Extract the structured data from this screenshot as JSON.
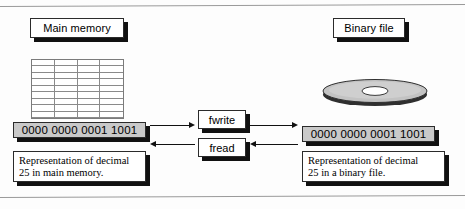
{
  "figure": {
    "type": "data-flow-diagram"
  },
  "labels": {
    "main_memory": "Main memory",
    "binary_file": "Binary file"
  },
  "memory_grid": {
    "columns": 4,
    "rows": 9,
    "name": "main-memory-cells"
  },
  "bars": {
    "memory_bits": "0000  0000  0001 1001",
    "file_bits": "0000  0000  0001 1001"
  },
  "captions": {
    "memory_line1": "Representation of decimal",
    "memory_line2": "25 in main memory.",
    "file_line1": "Representation of decimal",
    "file_line2": "25 in a binary file."
  },
  "functions": {
    "write": "fwrite",
    "read": "fread"
  },
  "arrows": [
    {
      "name": "memory-to-fwrite",
      "direction": "right"
    },
    {
      "name": "fread-to-memory",
      "direction": "left"
    },
    {
      "name": "fwrite-to-file",
      "direction": "right"
    },
    {
      "name": "file-to-fread",
      "direction": "left"
    }
  ],
  "icons": {
    "disk": "disk-platter-icon"
  },
  "colors": {
    "bar_fill": "#c9c9c9",
    "box_fill": "#ffffff",
    "outline": "#2b2b2b",
    "shadow": "#111111",
    "disk_top": "#c3c3c3",
    "disk_edge": "#2f2f2f",
    "grid_line": "#8a8a8a",
    "rule": "#9a9a9a"
  }
}
